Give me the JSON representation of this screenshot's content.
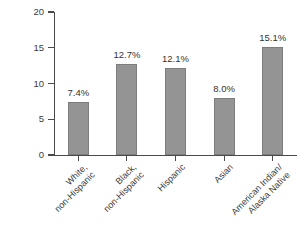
{
  "chart_data": {
    "type": "bar",
    "title": "",
    "subtitle": "",
    "xlabel": "",
    "ylabel": "Percentage",
    "ylim": [
      0,
      20
    ],
    "yticks": [
      "0",
      "5",
      "10",
      "15",
      "20"
    ],
    "grid": false,
    "legend": false,
    "bar_color": "#949494",
    "axis_color": "#4a4a4a",
    "categories": [
      "White,\nnon-Hispanic",
      "Black,\nnon-Hispanic",
      "Hispanic",
      "Asian",
      "American Indian/\nAlaska Native"
    ],
    "category_lines": [
      [
        "White,",
        "non-Hispanic"
      ],
      [
        "Black,",
        "non-Hispanic"
      ],
      [
        "Hispanic"
      ],
      [
        "Asian"
      ],
      [
        "American Indian/",
        "Alaska Native"
      ]
    ],
    "values": [
      7.4,
      12.7,
      12.1,
      8.0,
      15.1
    ],
    "data_labels": [
      "7.4%",
      "12.7%",
      "12.1%",
      "8.0%",
      "15.1%"
    ]
  },
  "axis": {
    "y_title": "Percentage",
    "y_ticks": [
      {
        "label": "20",
        "value": 20
      },
      {
        "label": "15",
        "value": 15
      },
      {
        "label": "10",
        "value": 10
      },
      {
        "label": "5",
        "value": 5
      },
      {
        "label": "0",
        "value": 0
      }
    ]
  },
  "bars": [
    {
      "label_line1": "White,",
      "label_line2": "non-Hispanic",
      "value_label": "7.4%",
      "value": 7.4
    },
    {
      "label_line1": "Black,",
      "label_line2": "non-Hispanic",
      "value_label": "12.7%",
      "value": 12.7
    },
    {
      "label_line1": "Hispanic",
      "label_line2": "",
      "value_label": "12.1%",
      "value": 12.1
    },
    {
      "label_line1": "Asian",
      "label_line2": "",
      "value_label": "8.0%",
      "value": 8.0
    },
    {
      "label_line1": "American Indian/",
      "label_line2": "Alaska Native",
      "value_label": "15.1%",
      "value": 15.1
    }
  ]
}
